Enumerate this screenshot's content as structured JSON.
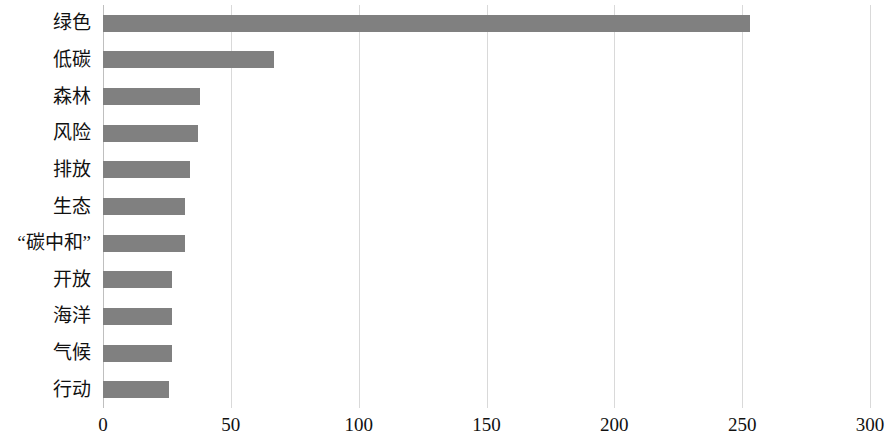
{
  "chart_data": {
    "type": "bar",
    "orientation": "horizontal",
    "title": "",
    "subtitle": "",
    "xlabel": "",
    "ylabel": "",
    "xlim": [
      0,
      300
    ],
    "ylim": null,
    "grid": true,
    "grid_axis": "x",
    "legend": false,
    "legend_position": "none",
    "categories": [
      "绿色",
      "低碳",
      "森林",
      "风险",
      "排放",
      "生态",
      "“碳中和”",
      "开放",
      "海洋",
      "气候",
      "行动"
    ],
    "values": [
      253,
      67,
      38,
      37,
      34,
      32,
      32,
      27,
      27,
      27,
      26
    ],
    "xticks": [
      0,
      50,
      100,
      150,
      200,
      250,
      300
    ],
    "xtick_labels": [
      "0",
      "50",
      "100",
      "150",
      "200",
      "250",
      "300"
    ],
    "series": [
      {
        "name": "",
        "values": [
          253,
          67,
          38,
          37,
          34,
          32,
          32,
          27,
          27,
          27,
          26
        ]
      }
    ],
    "colors": {
      "bar": "#808080",
      "gridline": "#d9d9d9",
      "axis": "#bfbfbf",
      "text": "#111111",
      "background": "#ffffff"
    }
  }
}
